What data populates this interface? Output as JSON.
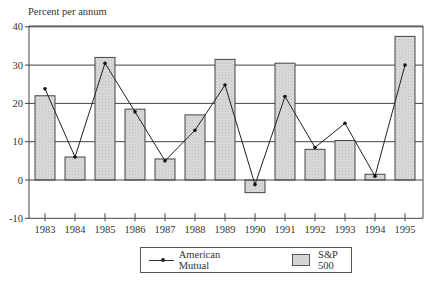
{
  "chart_data": {
    "type": "bar",
    "title": "",
    "ylabel": "Percent per annum",
    "xlabel": "",
    "ylim": [
      -10,
      40
    ],
    "yticks": [
      40,
      30,
      20,
      10,
      0,
      -10
    ],
    "grid": true,
    "legend_position": "bottom",
    "categories": [
      "1983",
      "1984",
      "1985",
      "1986",
      "1987",
      "1988",
      "1989",
      "1990",
      "1991",
      "1992",
      "1993",
      "1994",
      "1995"
    ],
    "series": [
      {
        "name": "S&P 500",
        "type": "bar",
        "color": "#d4d4d4",
        "values": [
          22,
          6,
          32,
          18.5,
          5.5,
          17,
          31.5,
          -3.3,
          30.5,
          8,
          10.3,
          1.5,
          37.5
        ]
      },
      {
        "name": "American Mutual",
        "type": "line",
        "color": "#222222",
        "values": [
          23.8,
          6,
          30.5,
          17.8,
          5,
          13,
          24.8,
          -1.2,
          21.8,
          8.5,
          14.8,
          1,
          30
        ]
      }
    ]
  },
  "axis": {
    "y_title": "Percent per annum",
    "y_ticks": [
      "40",
      "30",
      "20",
      "10",
      "0",
      "-10"
    ]
  },
  "legend": {
    "line_label": "American Mutual",
    "bar_label": "S&P 500"
  }
}
